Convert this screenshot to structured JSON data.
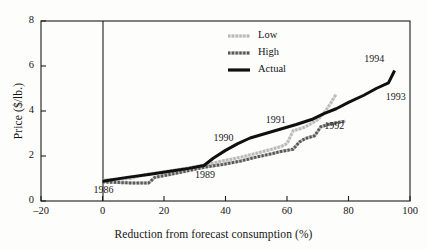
{
  "chart_data": {
    "type": "line",
    "title": "",
    "xlabel": "Reduction from forecast consumption (%)",
    "ylabel": "Price ($/lb.)",
    "xlim": [
      -20,
      100
    ],
    "ylim": [
      0,
      8
    ],
    "xticks": [
      -20,
      0,
      20,
      40,
      60,
      80,
      100
    ],
    "xtick_labels": [
      "–20",
      "0",
      "20",
      "40",
      "60",
      "80",
      "100"
    ],
    "yticks": [
      0,
      2,
      4,
      6,
      8
    ],
    "ytick_labels": [
      "0",
      "2",
      "4",
      "6",
      "8"
    ],
    "grid": false,
    "legend_position": "top-right",
    "series": [
      {
        "name": "Low",
        "style": "light-hatched",
        "color": "#b9b9b9",
        "points": [
          [
            0,
            0.92
          ],
          [
            4,
            0.95
          ],
          [
            9,
            1.0
          ],
          [
            14,
            1.18
          ],
          [
            20,
            1.3
          ],
          [
            27,
            1.45
          ],
          [
            33,
            1.6
          ],
          [
            39,
            1.78
          ],
          [
            45,
            1.95
          ],
          [
            50,
            2.12
          ],
          [
            55,
            2.3
          ],
          [
            58,
            2.42
          ],
          [
            60,
            2.55
          ],
          [
            62,
            3.12
          ],
          [
            64,
            3.2
          ],
          [
            66,
            3.3
          ],
          [
            68,
            3.45
          ],
          [
            70,
            3.62
          ],
          [
            72,
            3.9
          ],
          [
            74,
            4.3
          ],
          [
            76,
            4.75
          ]
        ]
      },
      {
        "name": "High",
        "style": "medium-hatched",
        "color": "#595959",
        "points": [
          [
            0,
            0.85
          ],
          [
            5,
            0.82
          ],
          [
            10,
            0.8
          ],
          [
            15,
            0.8
          ],
          [
            17,
            1.05
          ],
          [
            22,
            1.18
          ],
          [
            28,
            1.35
          ],
          [
            33,
            1.5
          ],
          [
            39,
            1.62
          ],
          [
            45,
            1.78
          ],
          [
            50,
            1.95
          ],
          [
            55,
            2.1
          ],
          [
            58,
            2.2
          ],
          [
            62,
            2.3
          ],
          [
            64,
            2.62
          ],
          [
            66,
            2.78
          ],
          [
            69,
            2.9
          ],
          [
            71,
            3.3
          ],
          [
            74,
            3.42
          ],
          [
            77,
            3.5
          ],
          [
            79,
            3.55
          ]
        ]
      },
      {
        "name": "Actual",
        "style": "solid",
        "color": "#101010",
        "points": [
          [
            0,
            0.88
          ],
          [
            8,
            1.05
          ],
          [
            15,
            1.18
          ],
          [
            22,
            1.32
          ],
          [
            28,
            1.45
          ],
          [
            33,
            1.58
          ],
          [
            36,
            1.9
          ],
          [
            40,
            2.25
          ],
          [
            44,
            2.55
          ],
          [
            48,
            2.8
          ],
          [
            53,
            3.0
          ],
          [
            58,
            3.2
          ],
          [
            63,
            3.4
          ],
          [
            68,
            3.62
          ],
          [
            72,
            3.88
          ],
          [
            76,
            4.1
          ],
          [
            80,
            4.38
          ],
          [
            85,
            4.7
          ],
          [
            89,
            5.0
          ],
          [
            93,
            5.25
          ],
          [
            95,
            5.8
          ]
        ]
      }
    ],
    "annotations": [
      {
        "label": "1986",
        "x": 1,
        "y": 0.45
      },
      {
        "label": "1989",
        "x": 34,
        "y": 1.1
      },
      {
        "label": "1990",
        "x": 40,
        "y": 2.75
      },
      {
        "label": "1991",
        "x": 57,
        "y": 3.55
      },
      {
        "label": "1992",
        "x": 76,
        "y": 3.3
      },
      {
        "label": "1993",
        "x": 96,
        "y": 4.6
      },
      {
        "label": "1994",
        "x": 89,
        "y": 6.25
      }
    ],
    "legend": [
      {
        "label": "Low",
        "style": "light-hatched"
      },
      {
        "label": "High",
        "style": "medium-hatched"
      },
      {
        "label": "Actual",
        "style": "solid"
      }
    ]
  }
}
